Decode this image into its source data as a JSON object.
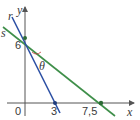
{
  "diagram": {
    "type": "coordinate-plane-lines",
    "axes": {
      "x_label": "x",
      "y_label": "y",
      "origin_label": "0"
    },
    "ticks": {
      "x": [
        "3",
        "7,5"
      ],
      "y": [
        "6"
      ]
    },
    "lines": [
      {
        "name": "r",
        "color": "#2b4fa3",
        "points": [
          [
            0,
            6
          ],
          [
            3,
            0
          ]
        ]
      },
      {
        "name": "s",
        "color": "#3f8f4a",
        "points": [
          [
            0,
            6
          ],
          [
            7.5,
            0
          ]
        ]
      }
    ],
    "angle_label": "θ",
    "colors": {
      "axis": "#555555",
      "point": "#1f3c7a",
      "point_s": "#2e6b38"
    }
  }
}
